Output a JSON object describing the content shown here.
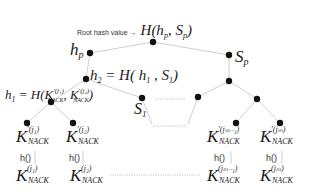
{
  "root": {
    "annotation": "Root hash value →",
    "formula": "H(h",
    "formula_sub_p1": "p",
    "formula_mid": ", S",
    "formula_sub_p2": "p",
    "formula_end": ")"
  },
  "hp": {
    "main": "h",
    "sub": "p"
  },
  "sp": {
    "main": "S",
    "sub": "p"
  },
  "h2": {
    "main": "h",
    "sub": "2",
    "eq": " = H( h",
    "sub1": "1",
    "mid": " , S",
    "sub2": "1",
    "end": ")"
  },
  "h1": {
    "main": "h",
    "sub": "1",
    "eq": " = H(K",
    "sup1": "′(j₁)",
    "nack1": "NACK",
    "comma": ", K",
    "sup2": "′(j₂)",
    "nack2": "NACK",
    "end": ")"
  },
  "s1": {
    "main": "S",
    "sub": "1"
  },
  "leaves": [
    {
      "top_sup": "′(j₁)",
      "bottom_sup": "(j₁)",
      "nack": "NACK",
      "k": "K",
      "hash_fn": "h()"
    },
    {
      "top_sup": "′(j₂)",
      "bottom_sup": "(j₂)",
      "nack": "NACK",
      "k": "K",
      "hash_fn": "h()"
    },
    {
      "top_sup": "′(jₘ₋₁)",
      "bottom_sup": "(jₘ₋₁)",
      "nack": "NACK",
      "k": "K",
      "hash_fn": "h()"
    },
    {
      "top_sup": "′(jₘ)",
      "bottom_sup": "(jₘ)",
      "nack": "NACK",
      "k": "K",
      "hash_fn": "h()"
    }
  ],
  "colors": {
    "node": "#111111",
    "edge": "#c8c8c8",
    "dotted": "#b0b0b0",
    "text": "#1a1a1a"
  }
}
